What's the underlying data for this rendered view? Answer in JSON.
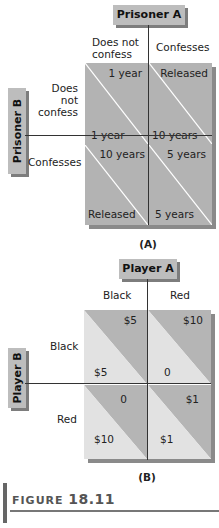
{
  "panel_a": {
    "player_col": "Prisoner A",
    "player_row": "Prisoner B",
    "col_labels": [
      "Does not\nconfess",
      "Confesses"
    ],
    "row_labels": [
      "Does\nnot\nconfess",
      "Confesses"
    ],
    "cells": [
      [
        {
          "a": "1 year",
          "b": "1 year"
        },
        {
          "a": "Released",
          "b": "10 years"
        }
      ],
      [
        {
          "a": "10 years",
          "b": "Released"
        },
        {
          "a": "5 years",
          "b": "5 years"
        }
      ]
    ],
    "caption": "(A)",
    "colors": {
      "cell": "#b3b3b3",
      "diagonal": "#ffffff",
      "header": "#bdbdbd"
    }
  },
  "panel_b": {
    "player_col": "Player A",
    "player_row": "Player B",
    "col_labels": [
      "Black",
      "Red"
    ],
    "row_labels": [
      "Black",
      "Red"
    ],
    "cells": [
      [
        {
          "a": "$5",
          "b": "$5"
        },
        {
          "a": "$10",
          "b": "0"
        }
      ],
      [
        {
          "a": "0",
          "b": "$10"
        },
        {
          "a": "$1",
          "b": "$1"
        }
      ]
    ],
    "caption": "(B)",
    "colors": {
      "upper": "#b5b5b5",
      "lower": "#e2e2e2",
      "header": "#bdbdbd"
    }
  },
  "figure": {
    "word": "FIGURE",
    "number": "18.11"
  }
}
